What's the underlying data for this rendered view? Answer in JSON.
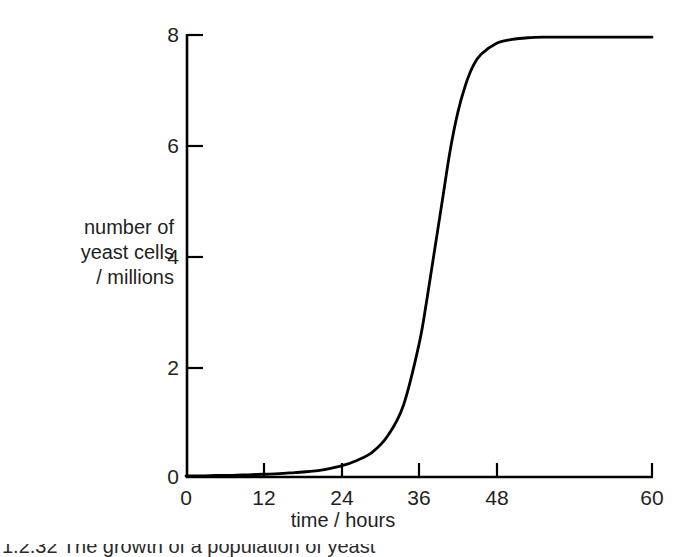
{
  "figure": {
    "background_color": "#ffffff",
    "line_color": "#000000",
    "axis_color": "#000000"
  },
  "axes": {
    "y_title_line1": "number of",
    "y_title_line2": "yeast cells",
    "y_title_line3": "/ millions",
    "x_title": "time / hours"
  },
  "caption": {
    "partial_text": "1.2.32 The growth of a population of yeast"
  },
  "chart_data": {
    "type": "line",
    "title": "",
    "subtitle": "",
    "xlabel": "time / hours",
    "ylabel": "number of yeast cells / millions",
    "xlim": [
      0,
      60
    ],
    "ylim": [
      0,
      8
    ],
    "xticks": [
      0,
      12,
      24,
      36,
      48,
      60
    ],
    "yticks": [
      0,
      2,
      4,
      6,
      8
    ],
    "xtick_labels": [
      "0",
      "12",
      "24",
      "36",
      "48",
      "60"
    ],
    "ytick_labels": [
      "0",
      "2",
      "4",
      "6",
      "8"
    ],
    "grid": false,
    "legend": false,
    "legend_position": "none",
    "series": [
      {
        "name": "yeast population",
        "x": [
          0,
          2,
          4,
          6,
          8,
          10,
          12,
          14,
          16,
          18,
          20,
          22,
          24,
          26,
          28,
          30,
          31,
          32,
          33,
          34,
          35,
          36,
          37,
          38,
          40,
          42,
          44,
          46,
          48,
          52,
          56,
          60
        ],
        "values": [
          0.02,
          0.02,
          0.03,
          0.03,
          0.04,
          0.05,
          0.06,
          0.08,
          0.1,
          0.14,
          0.2,
          0.3,
          0.45,
          0.75,
          1.3,
          2.4,
          3.2,
          4.1,
          5.0,
          5.9,
          6.6,
          7.1,
          7.45,
          7.65,
          7.85,
          7.92,
          7.95,
          7.96,
          7.96,
          7.96,
          7.96,
          7.96
        ]
      }
    ],
    "annotations": []
  }
}
